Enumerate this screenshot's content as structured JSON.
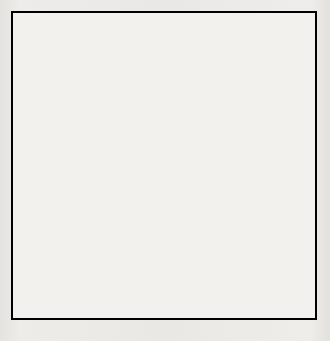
{
  "puzzle": {
    "title": "Crossword Puzzle Grid",
    "rows": 15,
    "columns": 15,
    "colors": {
      "block": "#090909",
      "cell": "#f4f3ef",
      "grid_line": "#5a5a58",
      "border": "#000000",
      "page_background": "#eceae6"
    },
    "grid": [
      [
        {
          "n": "1",
          "b": false
        },
        {
          "n": "2",
          "b": false
        },
        {
          "n": "3",
          "b": false
        },
        {
          "n": "4",
          "b": false
        },
        {
          "n": "",
          "b": true
        },
        {
          "n": "5",
          "b": false
        },
        {
          "n": "6",
          "b": false
        },
        {
          "n": "7",
          "b": false
        },
        {
          "n": "8",
          "b": false
        },
        {
          "n": "",
          "b": true
        },
        {
          "n": "",
          "b": true
        },
        {
          "n": "9",
          "b": false
        },
        {
          "n": "10",
          "b": false
        },
        {
          "n": "11",
          "b": false
        },
        {
          "n": "12",
          "b": false
        }
      ],
      [
        {
          "n": "13",
          "b": false
        },
        {
          "n": "",
          "b": false
        },
        {
          "n": "",
          "b": false
        },
        {
          "n": "",
          "b": false
        },
        {
          "n": "",
          "b": true
        },
        {
          "n": "14",
          "b": false
        },
        {
          "n": "",
          "b": false
        },
        {
          "n": "",
          "b": false
        },
        {
          "n": "",
          "b": false
        },
        {
          "n": "15",
          "b": false
        },
        {
          "n": "",
          "b": true
        },
        {
          "n": "16",
          "b": false
        },
        {
          "n": "",
          "b": false
        },
        {
          "n": "",
          "b": false
        },
        {
          "n": "",
          "b": false
        }
      ],
      [
        {
          "n": "17",
          "b": false
        },
        {
          "n": "",
          "b": false
        },
        {
          "n": "",
          "b": false
        },
        {
          "n": "",
          "b": false
        },
        {
          "n": "",
          "b": true
        },
        {
          "n": "18",
          "b": false
        },
        {
          "n": "",
          "b": false
        },
        {
          "n": "",
          "b": false
        },
        {
          "n": "",
          "b": false
        },
        {
          "n": "",
          "b": false
        },
        {
          "n": "",
          "b": true
        },
        {
          "n": "19",
          "b": false
        },
        {
          "n": "",
          "b": false
        },
        {
          "n": "",
          "b": false
        },
        {
          "n": "",
          "b": false
        }
      ],
      [
        {
          "n": "20",
          "b": false
        },
        {
          "n": "",
          "b": false
        },
        {
          "n": "",
          "b": false
        },
        {
          "n": "",
          "b": false
        },
        {
          "n": "21",
          "b": false
        },
        {
          "n": "",
          "b": false
        },
        {
          "n": "",
          "b": false
        },
        {
          "n": "",
          "b": false
        },
        {
          "n": "",
          "b": false
        },
        {
          "n": "",
          "b": false
        },
        {
          "n": "22",
          "b": false
        },
        {
          "n": "",
          "b": false
        },
        {
          "n": "",
          "b": false
        },
        {
          "n": "",
          "b": false
        },
        {
          "n": "",
          "b": true
        }
      ],
      [
        {
          "n": "23",
          "b": false
        },
        {
          "n": "",
          "b": false
        },
        {
          "n": "",
          "b": false
        },
        {
          "n": "",
          "b": true
        },
        {
          "n": "24",
          "b": false
        },
        {
          "n": "",
          "b": false
        },
        {
          "n": "",
          "b": false
        },
        {
          "n": "",
          "b": true
        },
        {
          "n": "",
          "b": true
        },
        {
          "n": "",
          "b": true
        },
        {
          "n": "25",
          "b": false
        },
        {
          "n": "",
          "b": false
        },
        {
          "n": "",
          "b": false
        },
        {
          "n": "",
          "b": false
        },
        {
          "n": "26",
          "b": false
        }
      ],
      [
        {
          "n": "27",
          "b": false
        },
        {
          "n": "",
          "b": false
        },
        {
          "n": "",
          "b": false
        },
        {
          "n": "28",
          "b": false
        },
        {
          "n": "",
          "b": false
        },
        {
          "n": "",
          "b": true
        },
        {
          "n": "",
          "b": true
        },
        {
          "n": "",
          "b": true
        },
        {
          "n": "29",
          "b": false
        },
        {
          "n": "30",
          "b": false
        },
        {
          "n": "",
          "b": false
        },
        {
          "n": "",
          "b": true
        },
        {
          "n": "31",
          "b": false
        },
        {
          "n": "",
          "b": false
        },
        {
          "n": "",
          "b": false
        }
      ],
      [
        {
          "n": "32",
          "b": false
        },
        {
          "n": "",
          "b": false
        },
        {
          "n": "",
          "b": false
        },
        {
          "n": "",
          "b": false
        },
        {
          "n": "",
          "b": true
        },
        {
          "n": "33",
          "b": false
        },
        {
          "n": "34",
          "b": false
        },
        {
          "n": "35",
          "b": false
        },
        {
          "n": "",
          "b": false
        },
        {
          "n": "",
          "b": false
        },
        {
          "n": "",
          "b": false
        },
        {
          "n": "",
          "b": true
        },
        {
          "n": "36",
          "b": false
        },
        {
          "n": "",
          "b": false
        },
        {
          "n": "",
          "b": false
        }
      ],
      [
        {
          "n": "",
          "b": true
        },
        {
          "n": "",
          "b": true
        },
        {
          "n": "",
          "b": true
        },
        {
          "n": "37",
          "b": false
        },
        {
          "n": "38",
          "b": false
        },
        {
          "n": "",
          "b": false
        },
        {
          "n": "",
          "b": false
        },
        {
          "n": "",
          "b": false
        },
        {
          "n": "",
          "b": false
        },
        {
          "n": "",
          "b": false
        },
        {
          "n": "39",
          "b": false
        },
        {
          "n": "",
          "b": true
        },
        {
          "n": "",
          "b": true
        },
        {
          "n": "",
          "b": true
        },
        {
          "n": "",
          "b": true
        }
      ],
      [
        {
          "n": "40",
          "b": false
        },
        {
          "n": "41",
          "b": false
        },
        {
          "n": "42",
          "b": false
        },
        {
          "n": "",
          "b": true
        },
        {
          "n": "43",
          "b": false
        },
        {
          "n": "",
          "b": false
        },
        {
          "n": "",
          "b": false
        },
        {
          "n": "",
          "b": false
        },
        {
          "n": "",
          "b": false
        },
        {
          "n": "",
          "b": true
        },
        {
          "n": "44",
          "b": false
        },
        {
          "n": "45",
          "b": false
        },
        {
          "n": "46",
          "b": false
        },
        {
          "n": "47",
          "b": false
        },
        {
          "n": "",
          "b": false
        }
      ],
      [
        {
          "n": "48",
          "b": false
        },
        {
          "n": "",
          "b": false
        },
        {
          "n": "",
          "b": false
        },
        {
          "n": "",
          "b": true
        },
        {
          "n": "49",
          "b": false
        },
        {
          "n": "",
          "b": false
        },
        {
          "n": "",
          "b": false
        },
        {
          "n": "",
          "b": true
        },
        {
          "n": "",
          "b": true
        },
        {
          "n": "",
          "b": true
        },
        {
          "n": "50",
          "b": false
        },
        {
          "n": "",
          "b": false
        },
        {
          "n": "",
          "b": false
        },
        {
          "n": "",
          "b": false
        },
        {
          "n": "",
          "b": false
        }
      ],
      [
        {
          "n": "51",
          "b": false
        },
        {
          "n": "",
          "b": false
        },
        {
          "n": "",
          "b": false
        },
        {
          "n": "52",
          "b": false
        },
        {
          "n": "",
          "b": false
        },
        {
          "n": "",
          "b": true
        },
        {
          "n": "",
          "b": true
        },
        {
          "n": "",
          "b": true
        },
        {
          "n": "53",
          "b": false
        },
        {
          "n": "54",
          "b": false
        },
        {
          "n": "",
          "b": false
        },
        {
          "n": "",
          "b": true
        },
        {
          "n": "55",
          "b": false
        },
        {
          "n": "",
          "b": false
        },
        {
          "n": "",
          "b": false
        }
      ],
      [
        {
          "n": "",
          "b": true
        },
        {
          "n": "56",
          "b": false
        },
        {
          "n": "",
          "b": false
        },
        {
          "n": "",
          "b": false
        },
        {
          "n": "",
          "b": false
        },
        {
          "n": "57",
          "b": false
        },
        {
          "n": "58",
          "b": false
        },
        {
          "n": "59",
          "b": false
        },
        {
          "n": "",
          "b": false
        },
        {
          "n": "",
          "b": false
        },
        {
          "n": "",
          "b": false
        },
        {
          "n": "60",
          "b": false
        },
        {
          "n": "",
          "b": false
        },
        {
          "n": "",
          "b": false
        },
        {
          "n": "",
          "b": false
        }
      ],
      [
        {
          "n": "61",
          "b": false
        },
        {
          "n": "",
          "b": false
        },
        {
          "n": "",
          "b": false
        },
        {
          "n": "",
          "b": false
        },
        {
          "n": "",
          "b": true
        },
        {
          "n": "62",
          "b": false
        },
        {
          "n": "",
          "b": false
        },
        {
          "n": "",
          "b": false
        },
        {
          "n": "",
          "b": false
        },
        {
          "n": "",
          "b": false
        },
        {
          "n": "",
          "b": false
        },
        {
          "n": "",
          "b": true
        },
        {
          "n": "63",
          "b": false
        },
        {
          "n": "",
          "b": false
        },
        {
          "n": "",
          "b": false
        }
      ],
      [
        {
          "n": "64",
          "b": false
        },
        {
          "n": "",
          "b": false
        },
        {
          "n": "",
          "b": false
        },
        {
          "n": "",
          "b": false
        },
        {
          "n": "",
          "b": true
        },
        {
          "n": "65",
          "b": false
        },
        {
          "n": "",
          "b": false
        },
        {
          "n": "",
          "b": false
        },
        {
          "n": "",
          "b": false
        },
        {
          "n": "",
          "b": false
        },
        {
          "n": "",
          "b": false
        },
        {
          "n": "",
          "b": true
        },
        {
          "n": "66",
          "b": false
        },
        {
          "n": "",
          "b": false
        },
        {
          "n": "",
          "b": false
        }
      ],
      [
        {
          "n": "67",
          "b": false
        },
        {
          "n": "",
          "b": false
        },
        {
          "n": "",
          "b": false
        },
        {
          "n": "",
          "b": false
        },
        {
          "n": "",
          "b": true
        },
        {
          "n": "",
          "b": true
        },
        {
          "n": "68",
          "b": false
        },
        {
          "n": "",
          "b": false
        },
        {
          "n": "",
          "b": false
        },
        {
          "n": "",
          "b": false
        },
        {
          "n": "",
          "b": false
        },
        {
          "n": "",
          "b": true
        },
        {
          "n": "69",
          "b": false
        },
        {
          "n": "",
          "b": false
        },
        {
          "n": "",
          "b": false
        }
      ]
    ]
  }
}
